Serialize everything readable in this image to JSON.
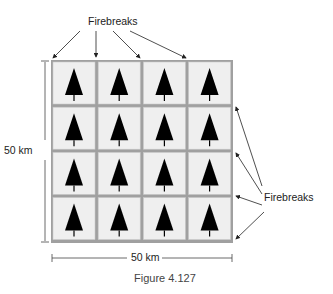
{
  "diagram": {
    "top_label": "Firebreaks",
    "right_label": "Firebreaks",
    "left_dimension": "50 km",
    "bottom_dimension": "50 km",
    "caption": "Figure 4.127",
    "grid": {
      "rows": 4,
      "cols": 4,
      "cell_icon": "tree-icon"
    },
    "colors": {
      "cell_fill": "#efefef",
      "firebreak": "#9a9a9a",
      "tree": "#000000",
      "line": "#333333"
    }
  }
}
